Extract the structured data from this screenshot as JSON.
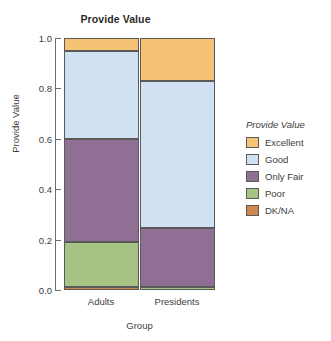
{
  "chart_data": {
    "type": "bar",
    "title": "Provide Value",
    "xlabel": "Group",
    "ylabel": "Provide Value",
    "categories": [
      "Adults",
      "Presidents"
    ],
    "ylim": [
      0.0,
      1.0
    ],
    "yticks": [
      "1.0",
      "0.8",
      "0.6",
      "0.4",
      "0.2",
      "0.0"
    ],
    "ytick_values": [
      1.0,
      0.8,
      0.6,
      0.4,
      0.2,
      0.0
    ],
    "grid": false,
    "stacked": true,
    "stack_order_top_to_bottom": [
      "Excellent",
      "Good",
      "Only Fair",
      "Poor",
      "DK/NA"
    ],
    "legend": {
      "title": "Provide Value",
      "position": "right",
      "entries": [
        {
          "label": "Excellent",
          "color": "#f5c373"
        },
        {
          "label": "Good",
          "color": "#cfe1f2"
        },
        {
          "label": "Only Fair",
          "color": "#8f6f93"
        },
        {
          "label": "Poor",
          "color": "#a7c285"
        },
        {
          "label": "DK/NA",
          "color": "#cf8750"
        }
      ]
    },
    "series": [
      {
        "name": "Excellent",
        "color": "#f5c373",
        "values": [
          0.05,
          0.17
        ]
      },
      {
        "name": "Good",
        "color": "#cfe1f2",
        "values": [
          0.35,
          0.585
        ]
      },
      {
        "name": "Only Fair",
        "color": "#8f6f93",
        "values": [
          0.41,
          0.235
        ]
      },
      {
        "name": "Poor",
        "color": "#a7c285",
        "values": [
          0.18,
          0.01
        ]
      },
      {
        "name": "DK/NA",
        "color": "#cf8750",
        "values": [
          0.01,
          0.0
        ]
      }
    ],
    "segments": {
      "Adults": [
        {
          "label": "DK/NA",
          "color": "#cf8750",
          "y0": 0.0,
          "y1": 0.01
        },
        {
          "label": "Poor",
          "color": "#a7c285",
          "y0": 0.01,
          "y1": 0.19
        },
        {
          "label": "Only Fair",
          "color": "#8f6f93",
          "y0": 0.19,
          "y1": 0.6
        },
        {
          "label": "Good",
          "color": "#cfe1f2",
          "y0": 0.6,
          "y1": 0.95
        },
        {
          "label": "Excellent",
          "color": "#f5c373",
          "y0": 0.95,
          "y1": 1.0
        }
      ],
      "Presidents": [
        {
          "label": "Poor",
          "color": "#a7c285",
          "y0": 0.0,
          "y1": 0.01
        },
        {
          "label": "Only Fair",
          "color": "#8f6f93",
          "y0": 0.01,
          "y1": 0.245
        },
        {
          "label": "Good",
          "color": "#cfe1f2",
          "y0": 0.245,
          "y1": 0.83
        },
        {
          "label": "Excellent",
          "color": "#f5c373",
          "y0": 0.83,
          "y1": 1.0
        }
      ]
    }
  }
}
